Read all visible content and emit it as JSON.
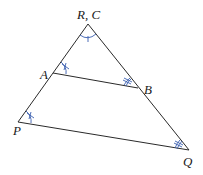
{
  "diagram": {
    "type": "similar-triangles",
    "colors": {
      "line": "#2a2a2a",
      "mark": "#3a5fb0",
      "label": "#1a1a1a"
    },
    "vertices": {
      "apex": {
        "label": "R, C",
        "x": 88,
        "y": 24
      },
      "A": {
        "label": "A",
        "x": 53,
        "y": 73
      },
      "B": {
        "label": "B",
        "x": 138,
        "y": 88
      },
      "P": {
        "label": "P",
        "x": 18,
        "y": 122
      },
      "Q": {
        "label": "Q",
        "x": 189,
        "y": 150
      }
    },
    "segments": [
      "apex-P",
      "apex-Q",
      "A-B",
      "P-Q"
    ],
    "angle_marks": [
      {
        "at": "apex",
        "style": "single-arc-one-tick"
      },
      {
        "at": "A",
        "style": "single-arc-cross"
      },
      {
        "at": "P",
        "style": "single-arc-cross"
      },
      {
        "at": "B",
        "style": "double-arc-ticks"
      },
      {
        "at": "Q",
        "style": "double-arc-ticks"
      }
    ]
  }
}
